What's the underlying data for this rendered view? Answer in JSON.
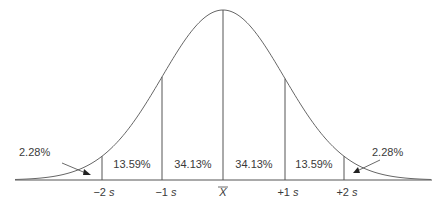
{
  "chart_data": {
    "type": "area",
    "title": "",
    "xlabel": "",
    "ylabel": "",
    "categories": [
      "-2s",
      "-1s",
      "mean",
      "+1s",
      "+2s"
    ],
    "bands": [
      {
        "range": "< -2s",
        "percent": 2.28
      },
      {
        "range": "-2s to -1s",
        "percent": 13.59
      },
      {
        "range": "-1s to mean",
        "percent": 34.13
      },
      {
        "range": "mean to +1s",
        "percent": 34.13
      },
      {
        "range": "+1s to +2s",
        "percent": 13.59
      },
      {
        "range": "> +2s",
        "percent": 2.28
      }
    ],
    "grid": false,
    "legend": "none"
  },
  "labels": {
    "tail_left": "2.28%",
    "band_m2_m1": "13.59%",
    "band_m1_mean": "34.13%",
    "band_mean_p1": "34.13%",
    "band_p1_p2": "13.59%",
    "tail_right": "2.28%"
  },
  "ticks": {
    "m2_sign": "−2",
    "m1_sign": "−1",
    "p1_sign": "+1",
    "p2_sign": "+2",
    "s": "s",
    "mean": "X"
  },
  "colors": {
    "line": "#555555",
    "text": "#3a3a3a"
  }
}
